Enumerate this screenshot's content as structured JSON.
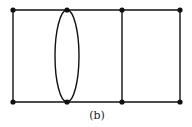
{
  "diagram": {
    "caption": "(b)",
    "nodes": [
      {
        "id": "t1",
        "x": 13,
        "y": 10
      },
      {
        "id": "t2",
        "x": 67,
        "y": 10
      },
      {
        "id": "t3",
        "x": 122,
        "y": 10
      },
      {
        "id": "t4",
        "x": 180,
        "y": 10
      },
      {
        "id": "b1",
        "x": 13,
        "y": 102
      },
      {
        "id": "b2",
        "x": 67,
        "y": 102
      },
      {
        "id": "b3",
        "x": 122,
        "y": 102
      },
      {
        "id": "b4",
        "x": 180,
        "y": 102
      }
    ],
    "edges": [
      [
        "t1",
        "t4"
      ],
      [
        "b1",
        "b4"
      ],
      [
        "t1",
        "b1"
      ],
      [
        "t3",
        "b3"
      ],
      [
        "t4",
        "b4"
      ]
    ],
    "double_edge": {
      "from": "t2",
      "to": "b2",
      "shape": "ellipse",
      "rx": 12
    }
  }
}
